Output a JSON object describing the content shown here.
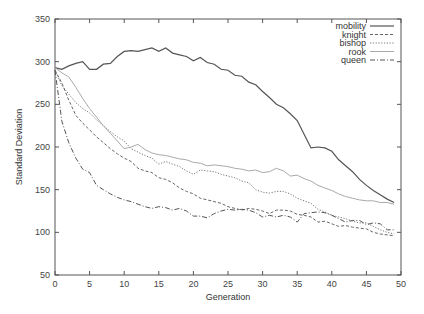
{
  "chart_data": {
    "type": "line",
    "title": "",
    "xlabel": "Generation",
    "ylabel": "Standard Deviation",
    "xlim": [
      0,
      50
    ],
    "ylim": [
      50,
      350
    ],
    "x_ticks": [
      0,
      5,
      10,
      15,
      20,
      25,
      30,
      35,
      40,
      45,
      50
    ],
    "y_ticks": [
      50,
      100,
      150,
      200,
      250,
      300,
      350
    ],
    "grid": false,
    "legend_position": "top-right",
    "x": [
      0,
      1,
      2,
      3,
      4,
      5,
      6,
      7,
      8,
      9,
      10,
      11,
      12,
      13,
      14,
      15,
      16,
      17,
      18,
      19,
      20,
      21,
      22,
      23,
      24,
      25,
      26,
      27,
      28,
      29,
      30,
      31,
      32,
      33,
      34,
      35,
      36,
      37,
      38,
      39,
      40,
      41,
      42,
      43,
      44,
      45,
      46,
      47,
      48,
      49
    ],
    "series": [
      {
        "name": "mobility",
        "style": "solid-dark",
        "values": [
          293,
          291,
          295,
          298,
          300,
          291,
          291,
          297,
          298,
          306,
          312,
          313,
          312,
          314,
          316,
          312,
          316,
          310,
          308,
          306,
          301,
          305,
          299,
          297,
          291,
          290,
          284,
          283,
          276,
          273,
          265,
          258,
          250,
          246,
          239,
          231,
          215,
          199,
          200,
          199,
          195,
          185,
          178,
          171,
          162,
          155,
          149,
          144,
          139,
          135
        ]
      },
      {
        "name": "knight",
        "style": "dashed",
        "values": [
          290,
          275,
          255,
          237,
          228,
          220,
          212,
          205,
          198,
          192,
          187,
          183,
          175,
          172,
          170,
          164,
          162,
          158,
          152,
          148,
          145,
          140,
          138,
          136,
          134,
          130,
          128,
          126,
          128,
          127,
          125,
          122,
          126,
          126,
          125,
          121,
          120,
          118,
          112,
          113,
          110,
          107,
          108,
          106,
          105,
          104,
          100,
          98,
          97,
          96
        ]
      },
      {
        "name": "bishop",
        "style": "dotted",
        "values": [
          290,
          272,
          262,
          252,
          245,
          240,
          232,
          225,
          218,
          212,
          207,
          198,
          194,
          190,
          187,
          180,
          183,
          180,
          177,
          172,
          168,
          173,
          172,
          171,
          168,
          166,
          164,
          160,
          158,
          150,
          147,
          146,
          148,
          148,
          145,
          140,
          137,
          134,
          127,
          124,
          120,
          118,
          116,
          113,
          111,
          111,
          107,
          103,
          100,
          98
        ]
      },
      {
        "name": "rook",
        "style": "solid-light",
        "values": [
          293,
          287,
          282,
          270,
          257,
          245,
          235,
          225,
          216,
          207,
          198,
          200,
          203,
          197,
          193,
          191,
          190,
          188,
          186,
          185,
          182,
          181,
          178,
          179,
          178,
          177,
          175,
          174,
          172,
          173,
          170,
          171,
          175,
          172,
          166,
          167,
          163,
          160,
          155,
          152,
          149,
          145,
          142,
          140,
          138,
          137,
          137,
          135,
          135,
          133
        ]
      },
      {
        "name": "queen",
        "style": "dash-dot",
        "values": [
          290,
          230,
          205,
          187,
          174,
          170,
          155,
          150,
          145,
          141,
          138,
          136,
          133,
          130,
          128,
          130,
          129,
          126,
          128,
          125,
          119,
          119,
          117,
          122,
          125,
          127,
          126,
          127,
          126,
          123,
          118,
          120,
          118,
          120,
          118,
          112,
          122,
          123,
          124,
          123,
          120,
          116,
          112,
          114,
          114,
          109,
          111,
          110,
          103,
          103
        ]
      }
    ]
  }
}
